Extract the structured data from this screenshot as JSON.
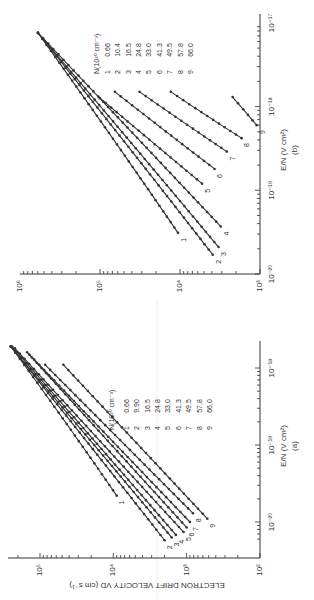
{
  "chart_data": [
    {
      "type": "line",
      "panel": "(a)",
      "title": "",
      "xlabel": "E/N (V cm^2)",
      "ylabel": "ELECTRON DRIFT VELOCITY V_D (cm s^-1)",
      "xscale": "log",
      "yscale": "log",
      "xlim": [
        5e-21,
        2e-18
      ],
      "ylim": [
        100,
        300000
      ],
      "x_ticks": [
        "10^-20",
        "10^-19",
        "10^-18"
      ],
      "y_ticks": [
        "10^2",
        "10^3",
        "10^4",
        "10^5"
      ],
      "grid": false,
      "legend": {
        "title": "N(10^20 cm^-3)",
        "entries": [
          {
            "id": "1",
            "value": "0.66"
          },
          {
            "id": "2",
            "value": "9.90"
          },
          {
            "id": "3",
            "value": "16.5"
          },
          {
            "id": "4",
            "value": "24.8"
          },
          {
            "id": "5",
            "value": "33.0"
          },
          {
            "id": "6",
            "value": "41.3"
          },
          {
            "id": "7",
            "value": "49.5"
          },
          {
            "id": "8",
            "value": "57.8"
          },
          {
            "id": "9",
            "value": "66.0"
          }
        ]
      },
      "series": [
        {
          "name": "1",
          "x": [
            2.2e-20,
            1.9e-18
          ],
          "y": [
            9000,
            250000
          ]
        },
        {
          "name": "2",
          "x": [
            5.8e-21,
            1.9e-18
          ],
          "y": [
            2000,
            250000
          ]
        },
        {
          "name": "3",
          "x": [
            6.3e-21,
            1.9e-18
          ],
          "y": [
            1600,
            250000
          ]
        },
        {
          "name": "4",
          "x": [
            6.8e-21,
            1.9e-18
          ],
          "y": [
            1400,
            240000
          ]
        },
        {
          "name": "5",
          "x": [
            7.4e-21,
            1.8e-18
          ],
          "y": [
            1100,
            220000
          ]
        },
        {
          "name": "6",
          "x": [
            8.5e-21,
            1.6e-18
          ],
          "y": [
            1000,
            150000
          ]
        },
        {
          "name": "7",
          "x": [
            1e-20,
            1.5e-18
          ],
          "y": [
            900,
            140000
          ]
        },
        {
          "name": "8",
          "x": [
            1.3e-20,
            1.1e-18
          ],
          "y": [
            820,
            85000
          ]
        },
        {
          "name": "9",
          "x": [
            1.1e-20,
            1.1e-18
          ],
          "y": [
            520,
            48000
          ]
        }
      ]
    },
    {
      "type": "line",
      "panel": "(b)",
      "title": "",
      "xlabel": "E/N (V cm^2)",
      "ylabel": "",
      "xscale": "log",
      "yscale": "log",
      "xlim": [
        1e-20,
        1e-17
      ],
      "ylim": [
        1000,
        1000000
      ],
      "x_ticks": [
        "10^-20",
        "10^-19",
        "10^-18",
        "10^-17"
      ],
      "y_ticks": [
        "10^3",
        "10^4",
        "10^5",
        "10^6"
      ],
      "grid": false,
      "legend": {
        "title": "N(10^20 cm^-3)",
        "entries": [
          {
            "id": "1",
            "value": "0.66"
          },
          {
            "id": "2",
            "value": "10.4"
          },
          {
            "id": "3",
            "value": "16.5"
          },
          {
            "id": "4",
            "value": "24.8"
          },
          {
            "id": "5",
            "value": "33.0"
          },
          {
            "id": "6",
            "value": "41.3"
          },
          {
            "id": "7",
            "value": "49.5"
          },
          {
            "id": "8",
            "value": "57.8"
          },
          {
            "id": "9",
            "value": "66.0"
          }
        ]
      },
      "series": [
        {
          "name": "1",
          "x": [
            3.1e-20,
            7.6e-18
          ],
          "y": [
            10600,
            596000
          ]
        },
        {
          "name": "2",
          "x": [
            1.7e-20,
            7.6e-18
          ],
          "y": [
            3900,
            596000
          ]
        },
        {
          "name": "3",
          "x": [
            2.1e-20,
            7.6e-18
          ],
          "y": [
            3300,
            596000
          ]
        },
        {
          "name": "4",
          "x": [
            3.7e-20,
            7.6e-18
          ],
          "y": [
            3100,
            596000
          ]
        },
        {
          "name": "5",
          "x": [
            1.2e-19,
            1.26e-18
          ],
          "y": [
            5300,
            100000
          ]
        },
        {
          "name": "6",
          "x": [
            1.8e-19,
            1.5e-18
          ],
          "y": [
            3700,
            65000
          ]
        },
        {
          "name": "7",
          "x": [
            2.9e-19,
            1.5e-18
          ],
          "y": [
            2600,
            32000
          ]
        },
        {
          "name": "8",
          "x": [
            4.2e-19,
            1.5e-18
          ],
          "y": [
            1700,
            13000
          ]
        },
        {
          "name": "9",
          "x": [
            6e-19,
            1.3e-18
          ],
          "y": [
            1100,
            2200
          ]
        }
      ]
    }
  ],
  "labels": {
    "a": {
      "ylabel": "ELECTRON DRIFT VELOCITY V",
      "ylabel_sub": "D",
      "ylabel_unit": "(cm s⁻¹)",
      "xlabel": "E/N (V cm²)",
      "panel": "(a)",
      "legend_title": "N(10²⁰ cm⁻³)",
      "xticks": [
        "10⁻²⁰",
        "10⁻¹⁹",
        "10⁻¹⁸"
      ],
      "yticks": [
        "10²",
        "10³",
        "10⁴",
        "10⁵"
      ],
      "legend_ids": [
        "1",
        "2",
        "3",
        "4",
        "5",
        "6",
        "7",
        "8",
        "9"
      ],
      "legend_vals": [
        "0.66",
        "9.90",
        "16.5",
        "24.8",
        "33.0",
        "41.3",
        "49.5",
        "57.8",
        "66.0"
      ]
    },
    "b": {
      "xlabel": "E/N (V cm²)",
      "panel": "(b)",
      "legend_title": "N(10²⁰ cm⁻³)",
      "xticks": [
        "10⁻²⁰",
        "10⁻¹⁹",
        "10⁻¹⁸",
        "10⁻¹⁷"
      ],
      "yticks": [
        "10³",
        "10⁴",
        "10⁵",
        "10⁶"
      ],
      "legend_ids": [
        "1",
        "2",
        "3",
        "4",
        "5",
        "6",
        "7",
        "8",
        "9"
      ],
      "legend_vals": [
        "0.66",
        "10.4",
        "16.5",
        "24.8",
        "33.0",
        "41.3",
        "49.5",
        "57.8",
        "66.0"
      ]
    }
  }
}
